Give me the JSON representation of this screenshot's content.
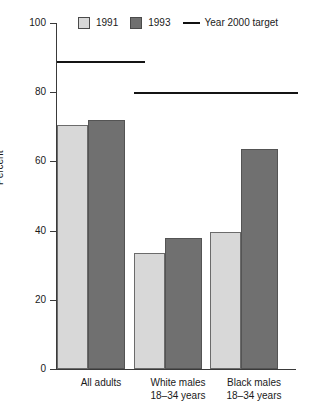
{
  "legend": {
    "items": [
      {
        "label": "1991",
        "type": "swatch",
        "color": "#d8d8d8",
        "icon": "legend-swatch-light"
      },
      {
        "label": "1993",
        "type": "swatch",
        "color": "#707070",
        "icon": "legend-swatch-dark"
      },
      {
        "label": "Year 2000 target",
        "type": "line",
        "color": "#111111",
        "icon": "legend-line"
      }
    ]
  },
  "axes": {
    "ylabel": "Percent",
    "yticks": [
      "0",
      "20",
      "40",
      "60",
      "80",
      "100"
    ],
    "ymin": 0,
    "ymax": 100
  },
  "chart_data": {
    "type": "bar",
    "title": "",
    "subtitle": "",
    "xlabel": "",
    "ylabel": "Percent",
    "ylim": [
      0,
      100
    ],
    "yticks": [
      0,
      20,
      40,
      60,
      80,
      100
    ],
    "grid": false,
    "legend_position": "top",
    "categories": [
      "All adults",
      "White males\n18–34 years",
      "Black males\n18–34 years"
    ],
    "category_lines": [
      [
        "All adults"
      ],
      [
        "White males",
        "18–34 years"
      ],
      [
        "Black males",
        "18–34 years"
      ]
    ],
    "series": [
      {
        "name": "1991",
        "color": "#d8d8d8",
        "values": [
          70.5,
          33.5,
          39.5
        ]
      },
      {
        "name": "1993",
        "color": "#707070",
        "values": [
          72.0,
          38.0,
          63.5
        ]
      }
    ],
    "target_series": {
      "name": "Year 2000 target",
      "color": "#111111",
      "values": [
        89.0,
        80.0,
        80.0
      ]
    }
  }
}
